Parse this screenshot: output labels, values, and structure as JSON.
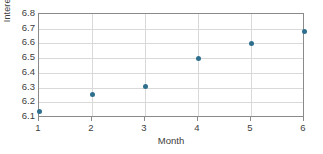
{
  "chart_data": {
    "type": "scatter",
    "title": "",
    "xlabel": "Month",
    "ylabel": "Interest rate (%)",
    "x": [
      1,
      2,
      3,
      4,
      5,
      6
    ],
    "values": [
      6.14,
      6.25,
      6.31,
      6.5,
      6.6,
      6.68
    ],
    "series": [
      {
        "name": "Interest rate",
        "values": [
          6.14,
          6.25,
          6.31,
          6.5,
          6.6,
          6.68
        ]
      }
    ],
    "x_tick_labels": [
      "1",
      "2",
      "3",
      "4",
      "5",
      "6"
    ],
    "y_tick_labels": [
      "6.1",
      "6.2",
      "6.3",
      "6.4",
      "6.5",
      "6.6",
      "6.7",
      "6.8"
    ],
    "y_ticks": [
      6.1,
      6.2,
      6.3,
      6.4,
      6.5,
      6.6,
      6.7,
      6.8
    ],
    "xlim": [
      1,
      6
    ],
    "ylim": [
      6.1,
      6.8
    ],
    "grid": "horizontal-and-vertical",
    "legend": "none",
    "point_color": "#2e6f8e",
    "grid_color": "#d9d9d9",
    "frame_color": "#8a8a8a",
    "background_color": "#ffffff"
  },
  "labels": {
    "x_axis_title": "Month",
    "y_axis_title": "Interest rate (%)"
  }
}
